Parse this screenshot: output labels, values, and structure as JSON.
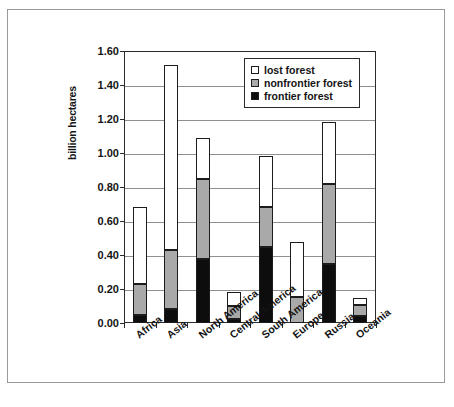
{
  "chart_data": {
    "type": "bar",
    "subtype": "stacked-bar",
    "title": "",
    "xlabel": "",
    "ylabel": "billion hectares",
    "ylim": [
      0.0,
      1.6
    ],
    "ytick_labels": [
      "1.60",
      "1.40",
      "1.20",
      "1.00",
      "0.80",
      "0.60",
      "0.40",
      "0.20",
      "0.00"
    ],
    "ytick_values": [
      1.6,
      1.4,
      1.2,
      1.0,
      0.8,
      0.6,
      0.4,
      0.2,
      0.0
    ],
    "grid": true,
    "grid_axis": "y",
    "legend_position": "top-right",
    "stack_order_bottom_to_top": [
      "frontier forest",
      "nonfrontier forest",
      "lost forest"
    ],
    "categories": [
      "Africa",
      "Asia",
      "North America",
      "Central America",
      "South America",
      "Europe",
      "Russia",
      "Oceania"
    ],
    "series": [
      {
        "name": "frontier forest",
        "color": "#0d0d0d",
        "values": [
          0.05,
          0.085,
          0.375,
          0.025,
          0.45,
          0.0,
          0.35,
          0.04
        ]
      },
      {
        "name": "nonfrontier forest",
        "color": "#a9a9a9",
        "values": [
          0.18,
          0.345,
          0.475,
          0.075,
          0.23,
          0.155,
          0.465,
          0.065
        ]
      },
      {
        "name": "lost forest",
        "color": "#ffffff",
        "values": [
          0.45,
          1.085,
          0.24,
          0.08,
          0.3,
          0.32,
          0.365,
          0.045
        ]
      }
    ],
    "cumulative_tops": {
      "frontier": [
        0.05,
        0.085,
        0.375,
        0.025,
        0.45,
        0.0,
        0.35,
        0.04
      ],
      "nonfrontier": [
        0.23,
        0.43,
        0.85,
        0.1,
        0.68,
        0.155,
        0.815,
        0.105
      ],
      "total": [
        0.68,
        1.515,
        1.09,
        0.18,
        0.98,
        0.475,
        1.18,
        0.15
      ]
    }
  },
  "legend": {
    "items": [
      {
        "label": "lost forest",
        "swatch": "lost"
      },
      {
        "label": "nonfrontier forest",
        "swatch": "nonfrontier"
      },
      {
        "label": "frontier forest",
        "swatch": "frontier"
      }
    ]
  },
  "axis": {
    "y_title": "billion hectares"
  },
  "caption": {
    "text": ""
  }
}
